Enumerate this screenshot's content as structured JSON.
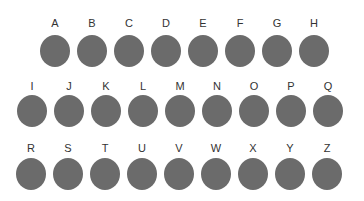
{
  "dot_color": "#6b6b6b",
  "rows": [
    {
      "letters": [
        "A",
        "B",
        "C",
        "D",
        "E",
        "F",
        "G",
        "H"
      ],
      "x0": 40,
      "letter_y": 17,
      "dot_y": 35
    },
    {
      "letters": [
        "I",
        "J",
        "K",
        "L",
        "M",
        "N",
        "O",
        "P",
        "Q"
      ],
      "x0": 17,
      "letter_y": 80,
      "dot_y": 95
    },
    {
      "letters": [
        "R",
        "S",
        "T",
        "U",
        "V",
        "W",
        "X",
        "Y",
        "Z"
      ],
      "x0": 16,
      "letter_y": 142,
      "dot_y": 158
    }
  ],
  "spacing": 37
}
